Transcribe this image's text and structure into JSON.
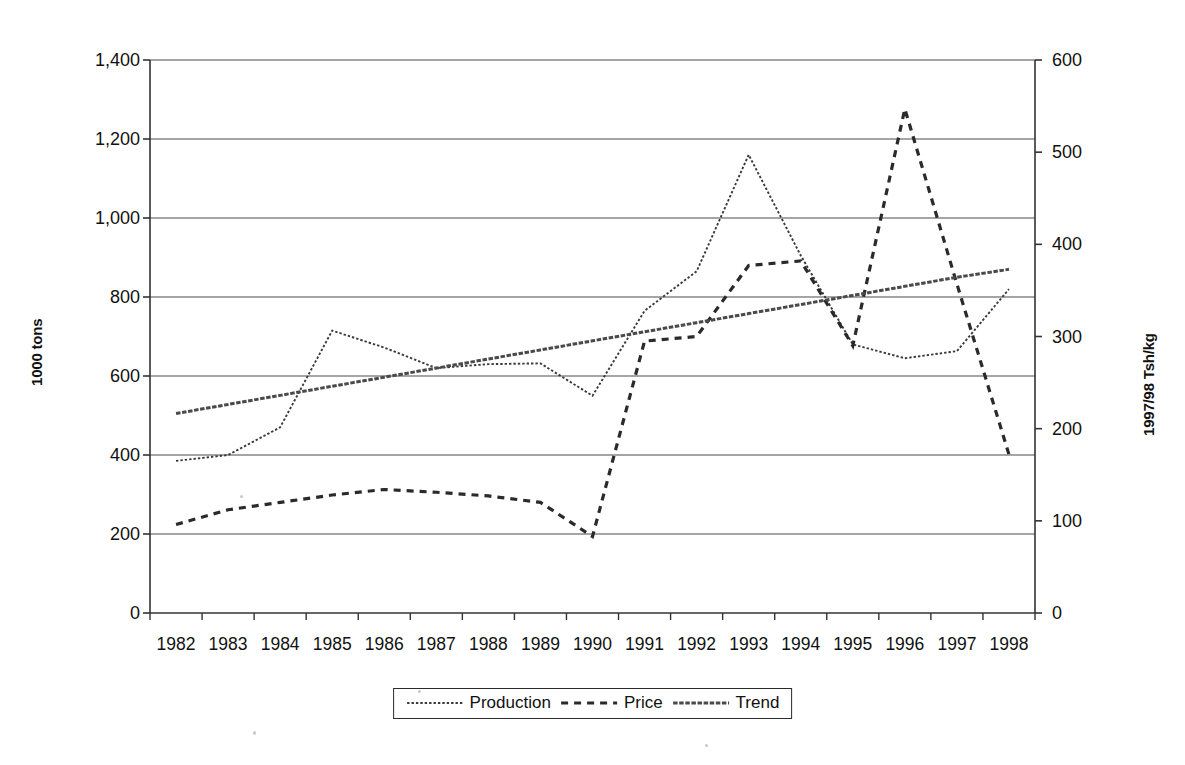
{
  "chart_data": {
    "type": "line",
    "title": "",
    "subtitle": "",
    "xlabel": "",
    "ylabel": "1000 tons",
    "ylabel_right": "1997/98 Tsh/kg",
    "categories": [
      "1982",
      "1983",
      "1984",
      "1985",
      "1986",
      "1987",
      "1988",
      "1989",
      "1990",
      "1991",
      "1992",
      "1993",
      "1994",
      "1995",
      "1996",
      "1997",
      "1998"
    ],
    "ylim": [
      0,
      1400
    ],
    "ylim_right": [
      0,
      600
    ],
    "yticks": [
      "0",
      "200",
      "400",
      "600",
      "800",
      "1,000",
      "1,200",
      "1,400"
    ],
    "ytick_values": [
      0,
      200,
      400,
      600,
      800,
      1000,
      1200,
      1400
    ],
    "yticks_right": [
      "0",
      "100",
      "200",
      "300",
      "400",
      "500",
      "600"
    ],
    "ytick_values_right": [
      0,
      100,
      200,
      300,
      400,
      500,
      600
    ],
    "grid": true,
    "legend_position": "bottom",
    "series": [
      {
        "name": "Production",
        "axis": "left",
        "style": "fine-dotted",
        "color": "#3a3a3a",
        "values": [
          385,
          400,
          470,
          715,
          672,
          620,
          630,
          632,
          550,
          765,
          865,
          1160,
          905,
          680,
          645,
          663,
          820
        ]
      },
      {
        "name": "Price",
        "axis": "right",
        "style": "dashed",
        "color": "#2a2a2a",
        "values": [
          96,
          112,
          120,
          128,
          134,
          131,
          127,
          120,
          83,
          295,
          300,
          377,
          382,
          290,
          547,
          357,
          172
        ]
      },
      {
        "name": "Trend",
        "axis": "left",
        "style": "dense-dash",
        "color": "#4a4a4a",
        "values": [
          505,
          528,
          551,
          574,
          597,
          620,
          643,
          666,
          689,
          712,
          735,
          758,
          781,
          804,
          827,
          850,
          870
        ]
      }
    ]
  },
  "legend": {
    "items": [
      {
        "label": "Production",
        "icon": "fine-dotted-line-icon"
      },
      {
        "label": "Price",
        "icon": "dashed-line-icon"
      },
      {
        "label": "Trend",
        "icon": "dense-dash-line-icon"
      }
    ]
  }
}
